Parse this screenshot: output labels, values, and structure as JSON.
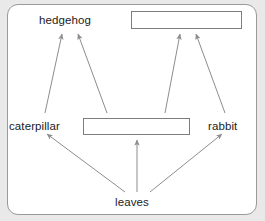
{
  "diagram": {
    "canvas": {
      "background_color": "#ffffff",
      "border_color": "#9a9a9a",
      "page_background_color": "#e9e9e9"
    },
    "nodes": [
      {
        "id": "hedgehog",
        "type": "text",
        "label": "hedgehog",
        "role": "predator"
      },
      {
        "id": "box_top_right",
        "type": "blank",
        "label": "",
        "role": "blank-answer-box"
      },
      {
        "id": "caterpillar",
        "type": "text",
        "label": "caterpillar",
        "role": "primary-consumer"
      },
      {
        "id": "box_middle",
        "type": "blank",
        "label": "",
        "role": "blank-answer-box"
      },
      {
        "id": "rabbit",
        "type": "text",
        "label": "rabbit",
        "role": "primary-consumer"
      },
      {
        "id": "leaves",
        "type": "text",
        "label": "leaves",
        "role": "producer"
      }
    ],
    "edges": [
      {
        "from": "leaves",
        "to": "caterpillar"
      },
      {
        "from": "leaves",
        "to": "box_middle"
      },
      {
        "from": "leaves",
        "to": "rabbit"
      },
      {
        "from": "caterpillar",
        "to": "hedgehog"
      },
      {
        "from": "box_middle",
        "to": "hedgehog"
      },
      {
        "from": "box_middle",
        "to": "box_top_right"
      },
      {
        "from": "rabbit",
        "to": "box_top_right"
      }
    ],
    "arrow_color": "#8d8d8d"
  }
}
